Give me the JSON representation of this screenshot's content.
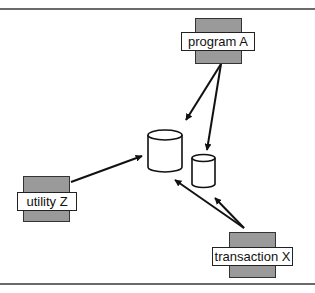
{
  "diagram": {
    "type": "data-flow",
    "nodes": [
      {
        "id": "program-a",
        "label": "program A",
        "kind": "program"
      },
      {
        "id": "utility-z",
        "label": "utility Z",
        "kind": "program"
      },
      {
        "id": "transaction-x",
        "label": "transaction X",
        "kind": "program"
      },
      {
        "id": "db-large",
        "label": "",
        "kind": "database"
      },
      {
        "id": "db-small",
        "label": "",
        "kind": "database"
      }
    ],
    "edges": [
      {
        "from": "program-a",
        "to": "db-large"
      },
      {
        "from": "program-a",
        "to": "db-small"
      },
      {
        "from": "utility-z",
        "to": "db-large"
      },
      {
        "from": "transaction-x",
        "to": "db-large"
      },
      {
        "from": "transaction-x",
        "to": "db-small"
      }
    ],
    "colors": {
      "program_back": "#9a9a9a",
      "label_bg": "#ffffff",
      "stroke": "#111111",
      "rule": "#6a6a6a"
    }
  }
}
